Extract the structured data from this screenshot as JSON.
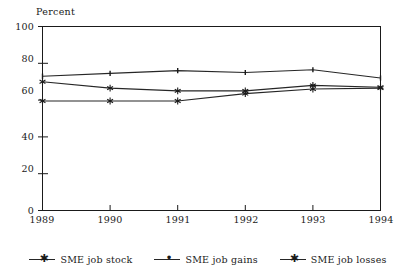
{
  "chart_data": {
    "type": "line",
    "title": "",
    "subtitle": "",
    "xlabel": "",
    "ylabel": "Percent",
    "categories": [
      "1989",
      "1990",
      "1991",
      "1992",
      "1993",
      "1994"
    ],
    "x": [
      1989,
      1990,
      1991,
      1992,
      1993,
      1994
    ],
    "xlim": [
      1989,
      1994
    ],
    "ylim": [
      0,
      100
    ],
    "yticks": [
      0,
      20,
      40,
      60,
      80,
      100
    ],
    "xticks": [
      1989,
      1990,
      1991,
      1992,
      1993,
      1994
    ],
    "grid": false,
    "legend_position": "bottom",
    "series": [
      {
        "name": "SME job stock",
        "marker": "star",
        "color": "#262626",
        "values": [
          70,
          66.5,
          65,
          65,
          68,
          67
        ]
      },
      {
        "name": "SME job gains",
        "marker": "dot",
        "color": "#262626",
        "values": [
          73,
          74.5,
          76,
          75,
          76.5,
          72
        ]
      },
      {
        "name": "SME job losses",
        "marker": "star",
        "color": "#262626",
        "values": [
          59.5,
          59.5,
          59.5,
          63.5,
          66,
          66.5
        ]
      }
    ]
  },
  "axis": {
    "y_title": "Percent",
    "y_tick_labels": [
      "100",
      "80",
      "60",
      "40",
      "20",
      "0"
    ],
    "x_tick_labels": [
      "1989",
      "1990",
      "1991",
      "1992",
      "1993",
      "1994"
    ]
  },
  "legend": {
    "items": [
      {
        "label": "SME job stock",
        "marker_glyph": "✳"
      },
      {
        "label": "SME job gains",
        "marker_glyph": "•"
      },
      {
        "label": "SME job losses",
        "marker_glyph": "✳"
      }
    ]
  },
  "colors": {
    "line": "#262626",
    "axis": "#1a1a1a",
    "background": "#ffffff"
  }
}
